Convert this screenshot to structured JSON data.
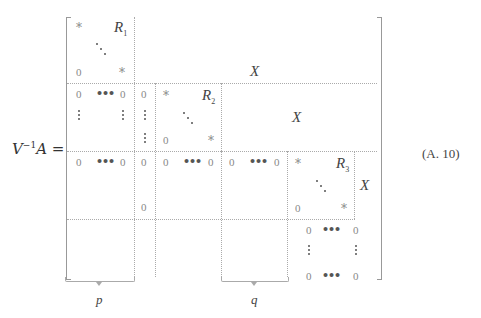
{
  "equation": {
    "lhs_base": "V",
    "lhs_exp": "−1",
    "lhs_rest": "A =",
    "number": "(A. 10)"
  },
  "matrix": {
    "block1": {
      "star": "*",
      "R": "R",
      "R_sub": "1",
      "zero": "0",
      "star2": "*"
    },
    "X_top": "X",
    "row2": {
      "zero": "0",
      "R": "R",
      "R_sub": "2",
      "star": "*",
      "X": "X"
    },
    "row3": {
      "zero": "0",
      "R": "R",
      "R_sub": "3",
      "star": "*",
      "X": "X"
    },
    "row4": {
      "zero": "0"
    }
  },
  "braces": {
    "p": "p",
    "q": "q"
  }
}
